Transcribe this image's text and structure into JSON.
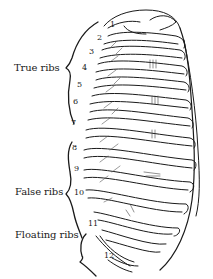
{
  "diagram": {
    "groups": [
      {
        "label": "True ribs",
        "ribs": "1-7"
      },
      {
        "label": "False ribs",
        "ribs": "8-10"
      },
      {
        "label": "Floating ribs",
        "ribs": "11-12"
      }
    ],
    "rib_numbers": [
      "1",
      "2",
      "3",
      "4",
      "5",
      "6",
      "7",
      "8",
      "9",
      "10",
      "11",
      "12"
    ],
    "colors": {
      "ink": "#1a1a1a",
      "background": "#ffffff"
    }
  }
}
